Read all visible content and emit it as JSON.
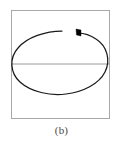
{
  "figure": {
    "caption": "(b)",
    "panel_label": "(b)",
    "frame": {
      "color": "#a8a8a8",
      "x": 11,
      "y": 10,
      "width": 99,
      "height": 109
    },
    "axis_line": {
      "name": "horizontal-midline",
      "color": "#9a9a9a",
      "y": 64,
      "x_start": 11,
      "x_end": 110
    },
    "curve": {
      "name": "open-ellipse-stroke",
      "color": "#1a1a1a",
      "description": "hand-drawn open elliptical loop with gap at top",
      "start_point": [
        78,
        33
      ],
      "end_point": [
        62,
        31
      ],
      "cx": 59,
      "cy": 63,
      "rx": 47,
      "ry": 31
    },
    "start_marker": {
      "name": "start-point-marker",
      "color": "#000000",
      "x": 76,
      "y": 29,
      "width": 5,
      "height": 7
    }
  }
}
